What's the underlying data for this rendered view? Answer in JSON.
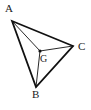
{
  "figure": {
    "type": "triangle-with-centroid",
    "width": 91,
    "height": 110,
    "background_color": "#ffffff",
    "stroke_color": "#111111",
    "outline_stroke_width": 1.8,
    "median_stroke_width": 0.9,
    "point_color": "#111111",
    "point_radius": 1.6
  },
  "points": {
    "A": {
      "label": "A",
      "x": 12,
      "y": 21
    },
    "B": {
      "label": "B",
      "x": 36,
      "y": 87
    },
    "C": {
      "label": "C",
      "x": 73,
      "y": 46
    },
    "G": {
      "label": "G",
      "x": 40,
      "y": 51
    }
  },
  "segments": {
    "outline": [
      {
        "name": "AB",
        "from": "A",
        "to": "B",
        "style": "thick"
      },
      {
        "name": "BC",
        "from": "B",
        "to": "C",
        "style": "thick"
      },
      {
        "name": "CA",
        "from": "C",
        "to": "A",
        "style": "thick"
      }
    ],
    "medians": [
      {
        "name": "AG",
        "from": "A",
        "to": "G",
        "style": "thin"
      },
      {
        "name": "BG",
        "from": "B",
        "to": "G",
        "style": "thin"
      },
      {
        "name": "CG",
        "from": "C",
        "to": "G",
        "style": "thin"
      }
    ]
  },
  "paths": {
    "triangle": "M 12 21 L 36 87 L 73 46 Z",
    "median_AG": "M 12 21 L 40 51",
    "median_BG": "M 36 87 L 40 51",
    "median_CG": "M 73 46 L 40 51"
  }
}
